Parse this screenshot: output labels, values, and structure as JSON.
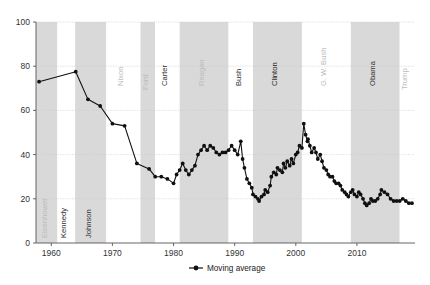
{
  "chart_data": {
    "type": "line",
    "title": "",
    "subtitle": "",
    "xlabel": "",
    "ylabel": "",
    "xlim": [
      1957.5,
      2019.5
    ],
    "ylim": [
      0,
      100
    ],
    "grid": true,
    "grid_axis": "y",
    "legend_position": "bottom-center",
    "x_ticks": [
      1960,
      1970,
      1980,
      1990,
      2000,
      2010
    ],
    "x_tick_labels": [
      "1960",
      "1970",
      "1980",
      "1990",
      "2000",
      "2010"
    ],
    "y_ticks": [
      0,
      20,
      40,
      60,
      80,
      100
    ],
    "y_tick_labels": [
      "0",
      "20",
      "40",
      "60",
      "80",
      "100"
    ],
    "series": [
      {
        "name": "Moving average",
        "color": "#101010",
        "marker": "circle",
        "x": [
          1958,
          1964,
          1966,
          1968,
          1970,
          1972,
          1974,
          1976,
          1977,
          1978,
          1979,
          1980,
          1980.5,
          1981,
          1981.5,
          1982,
          1982.5,
          1983,
          1983.5,
          1984,
          1984.5,
          1985,
          1985.5,
          1986,
          1986.5,
          1987,
          1987.5,
          1988,
          1988.5,
          1989,
          1989.5,
          1990,
          1990.5,
          1991,
          1991.3,
          1991.6,
          1992,
          1992.4,
          1992.8,
          1993,
          1993.4,
          1993.8,
          1994,
          1994.4,
          1994.8,
          1995,
          1995.4,
          1995.8,
          1996,
          1996.4,
          1996.8,
          1997,
          1997.4,
          1997.8,
          1998,
          1998.3,
          1998.6,
          1999,
          1999.3,
          1999.6,
          2000,
          2000.3,
          2000.6,
          2001,
          2001.3,
          2001.6,
          2001.9,
          2002,
          2002.3,
          2002.6,
          2003,
          2003.3,
          2003.6,
          2004,
          2004.3,
          2004.6,
          2005,
          2005.3,
          2005.6,
          2006,
          2006.3,
          2006.6,
          2007,
          2007.3,
          2007.6,
          2008,
          2008.3,
          2008.6,
          2009,
          2009.3,
          2009.6,
          2010,
          2010.3,
          2010.6,
          2011,
          2011.3,
          2011.6,
          2012,
          2012.3,
          2012.6,
          2013,
          2013.4,
          2013.8,
          2014,
          2014.5,
          2015,
          2015.5,
          2016,
          2016.5,
          2017,
          2017.5,
          2018,
          2018.5,
          2019
        ],
        "values": [
          73,
          77.5,
          65,
          62,
          54,
          53,
          36,
          33.5,
          30,
          30,
          29,
          27,
          31,
          33,
          36,
          33,
          31,
          33,
          35,
          40,
          42,
          44,
          42,
          44,
          43,
          41,
          40,
          41,
          41,
          42,
          44,
          42,
          40,
          46,
          38,
          34,
          29,
          27,
          25,
          22,
          21,
          20,
          19,
          21,
          22,
          24,
          23,
          26,
          30,
          32,
          31,
          34,
          33,
          32,
          36,
          34,
          37,
          35,
          38,
          36,
          40,
          41,
          44,
          43,
          54,
          49,
          46,
          47,
          44,
          41,
          43,
          41,
          38,
          40,
          37,
          34,
          33,
          31,
          30,
          30,
          28,
          27,
          27,
          26,
          24,
          23,
          22,
          21,
          23,
          24,
          22,
          21,
          23,
          22,
          20,
          18,
          17,
          18,
          20,
          19,
          19,
          20,
          22,
          24,
          23,
          22,
          20,
          19,
          19,
          19,
          20,
          19,
          18,
          18
        ],
        "legend_label": "Moving average"
      }
    ],
    "bands": {
      "label": "Presidential terms",
      "shaded_color": "#d9d9d9",
      "unshaded_color": "#ffffff",
      "items": [
        {
          "name": "Eisenhower",
          "start": 1957.5,
          "end": 1961.0,
          "shaded": true,
          "label_color": "#bcbcbc"
        },
        {
          "name": "Kennedy",
          "start": 1961.0,
          "end": 1963.9,
          "shaded": false,
          "label_color": "#333333"
        },
        {
          "name": "Johnson",
          "start": 1963.9,
          "end": 1969.0,
          "shaded": true,
          "label_color": "#333333"
        },
        {
          "name": "Nixon",
          "start": 1969.0,
          "end": 1974.6,
          "shaded": false,
          "label_color": "#bcbcbc"
        },
        {
          "name": "Ford",
          "start": 1974.6,
          "end": 1977.0,
          "shaded": true,
          "label_color": "#bcbcbc"
        },
        {
          "name": "Carter",
          "start": 1977.0,
          "end": 1981.0,
          "shaded": false,
          "label_color": "#333333"
        },
        {
          "name": "Reagan",
          "start": 1981.0,
          "end": 1989.0,
          "shaded": true,
          "label_color": "#bcbcbc"
        },
        {
          "name": "Bush",
          "start": 1989.0,
          "end": 1993.0,
          "shaded": false,
          "label_color": "#333333"
        },
        {
          "name": "Clinton",
          "start": 1993.0,
          "end": 2001.0,
          "shaded": true,
          "label_color": "#222222"
        },
        {
          "name": "G. W. Bush",
          "start": 2001.0,
          "end": 2009.0,
          "shaded": false,
          "label_color": "#bcbcbc"
        },
        {
          "name": "Obama",
          "start": 2009.0,
          "end": 2017.0,
          "shaded": true,
          "label_color": "#333333"
        },
        {
          "name": "Trump",
          "start": 2017.0,
          "end": 2019.5,
          "shaded": false,
          "label_color": "#bcbcbc"
        }
      ]
    }
  },
  "legend": {
    "label": "Moving average"
  }
}
